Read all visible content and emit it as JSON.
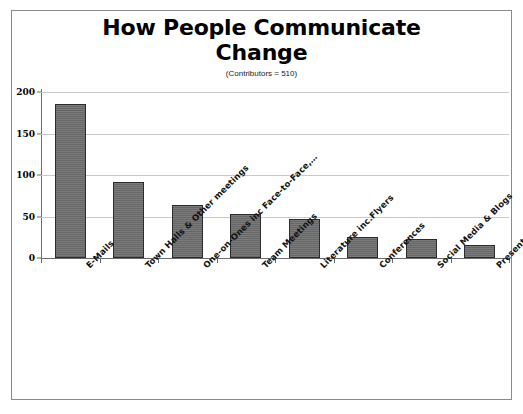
{
  "chart_data": {
    "type": "bar",
    "title": "How People Communicate Change",
    "subtitle": "(Contributors = 510)",
    "xlabel": "",
    "ylabel": "",
    "ylim": [
      0,
      200
    ],
    "yticks": [
      0,
      50,
      100,
      150,
      200
    ],
    "grid": true,
    "legend": "none",
    "bar_color": "#6c6c6c",
    "bar_border_color": "#2b2b2b",
    "categories": [
      "E-Mails",
      "Town Halls & Other meetings",
      "One-on-Ones inc Face-to-Face,…",
      "Team Meetings",
      "Literature inc.Flyers",
      "Conferences",
      "Social Media & Blogs",
      "Presentations & Briefings"
    ],
    "values": [
      185,
      91,
      64,
      53,
      47,
      25,
      23,
      16
    ]
  },
  "yaxis": {
    "tick_labels": [
      "200",
      "150",
      "100",
      "50",
      "0"
    ]
  }
}
